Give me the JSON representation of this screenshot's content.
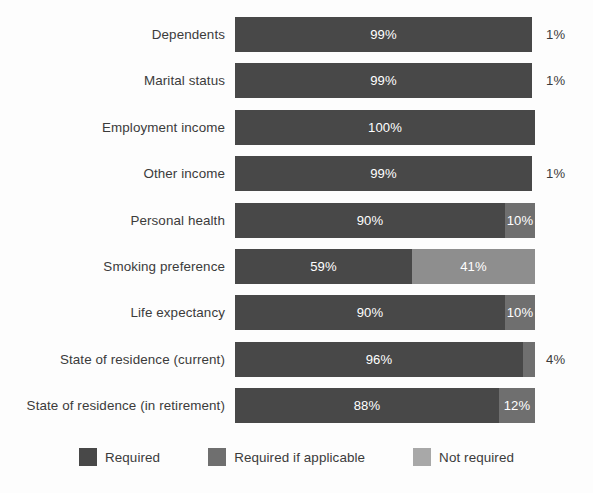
{
  "chart_data": {
    "type": "bar",
    "orientation": "horizontal",
    "stacked": true,
    "title": "",
    "subtitle": "",
    "xlabel": "",
    "ylabel": "",
    "xlim": [
      0,
      100
    ],
    "grid": false,
    "legend_position": "bottom",
    "categories": [
      "Dependents",
      "Marital status",
      "Employment income",
      "Other income",
      "Personal health",
      "Smoking preference",
      "Life expectancy",
      "State of residence (current)",
      "State of residence (in retirement)"
    ],
    "series": [
      {
        "name": "Required",
        "color": "#484848",
        "values": [
          99,
          99,
          100,
          99,
          90,
          59,
          90,
          96,
          88
        ]
      },
      {
        "name": "Required if applicable",
        "color": "#6f6f6f",
        "values": [
          0,
          0,
          0,
          0,
          10,
          0,
          10,
          4,
          12
        ]
      },
      {
        "name": "Not required",
        "color": "#a8a8a8",
        "values": [
          1,
          1,
          0,
          1,
          0,
          41,
          0,
          0,
          0
        ]
      }
    ]
  },
  "rows": [
    {
      "label": "Dependents",
      "segments": [
        {
          "value": 99,
          "text": "99%",
          "series": "Required",
          "color": "#484848",
          "label_inside": true
        }
      ],
      "outside_label": "1%"
    },
    {
      "label": "Marital status",
      "segments": [
        {
          "value": 99,
          "text": "99%",
          "series": "Required",
          "color": "#484848",
          "label_inside": true
        }
      ],
      "outside_label": "1%"
    },
    {
      "label": "Employment income",
      "segments": [
        {
          "value": 100,
          "text": "100%",
          "series": "Required",
          "color": "#484848",
          "label_inside": true
        }
      ],
      "outside_label": ""
    },
    {
      "label": "Other income",
      "segments": [
        {
          "value": 99,
          "text": "99%",
          "series": "Required",
          "color": "#484848",
          "label_inside": true
        }
      ],
      "outside_label": "1%"
    },
    {
      "label": "Personal health",
      "segments": [
        {
          "value": 90,
          "text": "90%",
          "series": "Required",
          "color": "#484848",
          "label_inside": true
        },
        {
          "value": 10,
          "text": "10%",
          "series": "Required if applicable",
          "color": "#6f6f6f",
          "label_inside": true
        }
      ],
      "outside_label": ""
    },
    {
      "label": "Smoking preference",
      "segments": [
        {
          "value": 59,
          "text": "59%",
          "series": "Required",
          "color": "#484848",
          "label_inside": true
        },
        {
          "value": 41,
          "text": "41%",
          "series": "Not required",
          "color": "#8e8e8e",
          "label_inside": true
        }
      ],
      "outside_label": ""
    },
    {
      "label": "Life expectancy",
      "segments": [
        {
          "value": 90,
          "text": "90%",
          "series": "Required",
          "color": "#484848",
          "label_inside": true
        },
        {
          "value": 10,
          "text": "10%",
          "series": "Required if applicable",
          "color": "#6f6f6f",
          "label_inside": true
        }
      ],
      "outside_label": ""
    },
    {
      "label": "State of residence (current)",
      "segments": [
        {
          "value": 96,
          "text": "96%",
          "series": "Required",
          "color": "#484848",
          "label_inside": true
        },
        {
          "value": 4,
          "text": "",
          "series": "Required if applicable",
          "color": "#6f6f6f",
          "label_inside": false
        }
      ],
      "outside_label": "4%"
    },
    {
      "label": "State of residence (in retirement)",
      "segments": [
        {
          "value": 88,
          "text": "88%",
          "series": "Required",
          "color": "#484848",
          "label_inside": true
        },
        {
          "value": 12,
          "text": "12%",
          "series": "Required if applicable",
          "color": "#6f6f6f",
          "label_inside": true
        }
      ],
      "outside_label": ""
    }
  ],
  "legend": {
    "items": [
      {
        "label": "Required",
        "color": "#484848"
      },
      {
        "label": "Required if applicable",
        "color": "#6f6f6f"
      },
      {
        "label": "Not required",
        "color": "#a8a8a8"
      }
    ]
  }
}
